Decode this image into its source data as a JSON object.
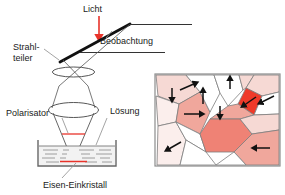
{
  "figure": {
    "type": "scientific-diagram",
    "background": "#ffffff"
  },
  "labels": {
    "light": "Licht",
    "observation": "Beobachtung",
    "beam_splitter_line1": "Strahl-",
    "beam_splitter_line2": "teiler",
    "polarizer": "Polarisator",
    "solution": "Lösung",
    "crystal": "Eisen-Einkristall"
  },
  "colors": {
    "ink": "#1a1a1a",
    "arrow_red": "#e8332a",
    "marker_red": "#e8332a",
    "leader_gray": "#9a9a9a",
    "panel_border": "#8c8c8c",
    "grain_fill_pale": "#fbeeec",
    "grain_fill_light": "#f6d9d4",
    "grain_fill_mid": "#f0a79c",
    "grain_fill_strong": "#ef8275",
    "grain_fill_bright": "#ef3a2a",
    "grain_white": "#ffffff",
    "grain_edge": "#7d7d7d"
  },
  "optics": {
    "light_arrow": {
      "x": 99,
      "y_from": 16,
      "y_to": 40,
      "color": "#e8332a"
    },
    "beam_splitter": {
      "x1": 62,
      "y1": 61,
      "x2": 128,
      "y2": 25,
      "width": 2.6
    },
    "observation_lines": [
      {
        "x1": 128,
        "y1": 25,
        "x2": 190,
        "y2": 25
      },
      {
        "x1": 82,
        "y1": 52,
        "x2": 163,
        "y2": 52
      }
    ],
    "upper_lens": {
      "cx": 73,
      "cy": 72,
      "rx": 21,
      "ry": 5
    },
    "lower_lens": {
      "cx": 73,
      "cy": 111,
      "rx": 25,
      "ry": 7
    },
    "polarizer_mark": {
      "x1": 62,
      "y1": 134,
      "x2": 84,
      "y2": 134
    },
    "crystal_mark": {
      "x1": 60,
      "y1": 161,
      "x2": 86,
      "y2": 161
    },
    "beaker": {
      "x": 38,
      "y": 140,
      "w": 78,
      "h": 26,
      "liquid_top": 145
    },
    "liquid_dash_rows": 5
  },
  "grain_panel": {
    "x": 155,
    "y": 74,
    "w": 125,
    "h": 92,
    "grain_count": 14,
    "arrow_count": 10,
    "arrows": [
      {
        "dir": "up-right"
      },
      {
        "dir": "down"
      },
      {
        "dir": "right"
      },
      {
        "dir": "up"
      },
      {
        "dir": "up"
      },
      {
        "dir": "down"
      },
      {
        "dir": "down-left"
      },
      {
        "dir": "left"
      },
      {
        "dir": "left"
      },
      {
        "dir": "down-left"
      }
    ]
  }
}
